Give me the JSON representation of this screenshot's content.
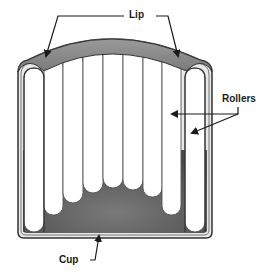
{
  "diagram": {
    "labels": {
      "lip": "Lip",
      "rollers": "Rollers",
      "cup": "Cup"
    },
    "colors": {
      "lip_fill": "#8c8c8c",
      "cup_fill": "#5a5a5a",
      "roller_fill": "#ffffff",
      "outline": "#333333",
      "arrow": "#1a1a1a"
    },
    "roller_count": 10
  }
}
